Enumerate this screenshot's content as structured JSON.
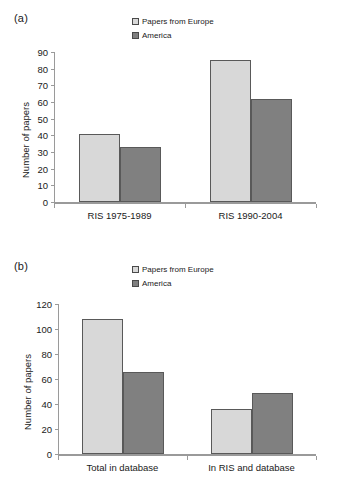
{
  "figure": {
    "panels": [
      {
        "label": "(a)",
        "ylabel": "Number of papers"
      },
      {
        "label": "(b)",
        "ylabel": "Number of papers"
      }
    ]
  },
  "legend": {
    "entries": [
      {
        "label": "Papers from Europe",
        "color": "#d8d8d8",
        "swatch_icon": "legend-swatch-icon"
      },
      {
        "label": "America",
        "color": "#808080",
        "swatch_icon": "legend-swatch-icon"
      }
    ]
  },
  "colors": {
    "europe": "#d8d8d8",
    "america": "#808080",
    "bar_border": "#595959",
    "axis": "#9a9a9a",
    "text": "#1a1a1a",
    "background": "#ffffff"
  },
  "chart_data": [
    {
      "type": "bar",
      "panel": "(a)",
      "title": "",
      "xlabel": "",
      "ylabel": "Number of papers",
      "categories": [
        "RIS 1975-1989",
        "RIS 1990-2004"
      ],
      "series": [
        {
          "name": "Papers from Europe",
          "values": [
            41,
            85
          ],
          "color": "#d8d8d8"
        },
        {
          "name": "America",
          "values": [
            33,
            62
          ],
          "color": "#808080"
        }
      ],
      "ylim": [
        0,
        90
      ],
      "yticks": [
        0,
        10,
        20,
        30,
        40,
        50,
        60,
        70,
        80,
        90
      ],
      "ytick_labels": [
        "0",
        "10",
        "20",
        "30",
        "40",
        "50",
        "60",
        "70",
        "80",
        "90"
      ],
      "grid": false,
      "legend_position": "top-center"
    },
    {
      "type": "bar",
      "panel": "(b)",
      "title": "",
      "xlabel": "",
      "ylabel": "Number of papers",
      "categories": [
        "Total in database",
        "In RIS and database"
      ],
      "series": [
        {
          "name": "Papers from Europe",
          "values": [
            108,
            36
          ],
          "color": "#d8d8d8"
        },
        {
          "name": "America",
          "values": [
            66,
            49
          ],
          "color": "#808080"
        }
      ],
      "ylim": [
        0,
        120
      ],
      "yticks": [
        0,
        20,
        40,
        60,
        80,
        100,
        120
      ],
      "ytick_labels": [
        "0",
        "20",
        "40",
        "60",
        "80",
        "100",
        "120"
      ],
      "grid": false,
      "legend_position": "top-center"
    }
  ]
}
